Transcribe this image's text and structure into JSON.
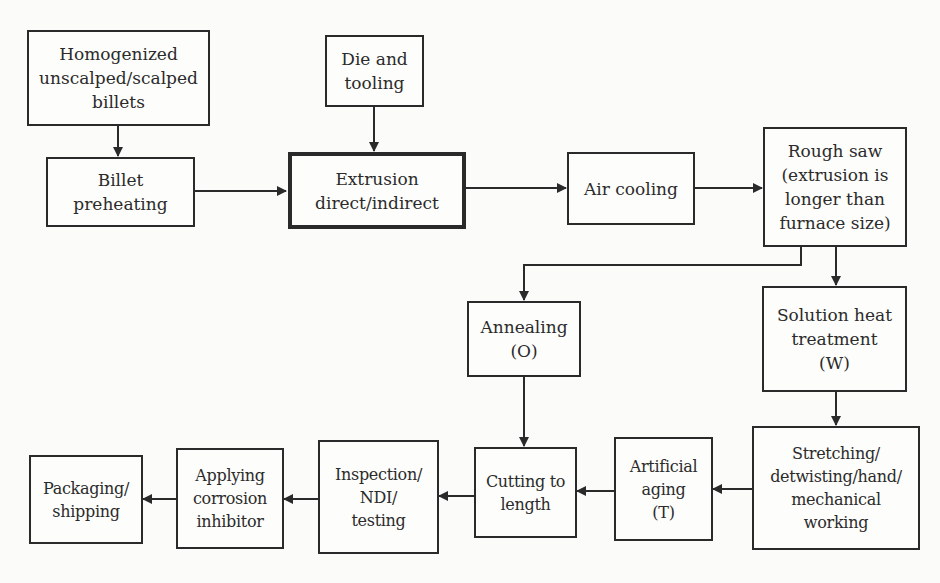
{
  "diagram": {
    "line_color": "#2a2a2a",
    "nodes": [
      {
        "id": "homogenized",
        "label": "Homogenized\nunscalped/scalped\nbillets"
      },
      {
        "id": "billet-preheating",
        "label": "Billet\npreheating"
      },
      {
        "id": "die-tooling",
        "label": "Die and\ntooling"
      },
      {
        "id": "extrusion",
        "label": "Extrusion\ndirect/indirect",
        "emphasis": "thick-border"
      },
      {
        "id": "air-cooling",
        "label": "Air cooling"
      },
      {
        "id": "rough-saw",
        "label": "Rough saw\n(extrusion is\nlonger than\nfurnace size)"
      },
      {
        "id": "annealing",
        "label": "Annealing\n(O)"
      },
      {
        "id": "solution-heat-treatment",
        "label": "Solution heat\ntreatment\n(W)"
      },
      {
        "id": "stretching",
        "label": "Stretching/\ndetwisting/hand/\nmechanical\nworking"
      },
      {
        "id": "artificial-aging",
        "label": "Artificial\naging\n(T)"
      },
      {
        "id": "cutting-to-length",
        "label": "Cutting to\nlength"
      },
      {
        "id": "inspection",
        "label": "Inspection/\nNDI/\ntesting"
      },
      {
        "id": "applying-corrosion-inhibitor",
        "label": "Applying\ncorrosion\ninhibitor"
      },
      {
        "id": "packaging",
        "label": "Packaging/\nshipping"
      }
    ],
    "edges": [
      {
        "from": "homogenized",
        "to": "billet-preheating"
      },
      {
        "from": "billet-preheating",
        "to": "extrusion"
      },
      {
        "from": "die-tooling",
        "to": "extrusion"
      },
      {
        "from": "extrusion",
        "to": "air-cooling"
      },
      {
        "from": "air-cooling",
        "to": "rough-saw"
      },
      {
        "from": "rough-saw",
        "to": "annealing"
      },
      {
        "from": "rough-saw",
        "to": "solution-heat-treatment"
      },
      {
        "from": "annealing",
        "to": "cutting-to-length"
      },
      {
        "from": "solution-heat-treatment",
        "to": "stretching"
      },
      {
        "from": "stretching",
        "to": "artificial-aging"
      },
      {
        "from": "artificial-aging",
        "to": "cutting-to-length"
      },
      {
        "from": "cutting-to-length",
        "to": "inspection"
      },
      {
        "from": "inspection",
        "to": "applying-corrosion-inhibitor"
      },
      {
        "from": "applying-corrosion-inhibitor",
        "to": "packaging"
      }
    ]
  }
}
